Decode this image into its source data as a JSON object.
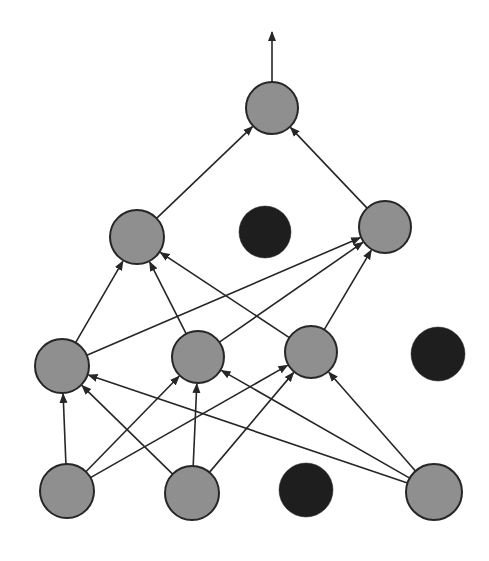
{
  "diagram": {
    "type": "network-graph",
    "colors": {
      "background": "#ffffff",
      "active_node_fill": "#8f8f8f",
      "dropped_node_fill": "#1e1e1e",
      "stroke": "#262626",
      "edge": "#262626"
    },
    "nodes": [
      {
        "id": "out",
        "layer": 0,
        "x": 272,
        "y": 108,
        "r": 26,
        "state": "active"
      },
      {
        "id": "h2a",
        "layer": 1,
        "x": 137,
        "y": 237,
        "r": 27,
        "state": "active"
      },
      {
        "id": "h2b",
        "layer": 1,
        "x": 265,
        "y": 232,
        "r": 26,
        "state": "dropped"
      },
      {
        "id": "h2c",
        "layer": 1,
        "x": 385,
        "y": 227,
        "r": 26,
        "state": "active"
      },
      {
        "id": "h1a",
        "layer": 2,
        "x": 62,
        "y": 366,
        "r": 27,
        "state": "active"
      },
      {
        "id": "h1b",
        "layer": 2,
        "x": 198,
        "y": 357,
        "r": 26,
        "state": "active"
      },
      {
        "id": "h1c",
        "layer": 2,
        "x": 311,
        "y": 352,
        "r": 26,
        "state": "active"
      },
      {
        "id": "h1d",
        "layer": 2,
        "x": 438,
        "y": 354,
        "r": 27,
        "state": "dropped"
      },
      {
        "id": "in_a",
        "layer": 3,
        "x": 67,
        "y": 491,
        "r": 27,
        "state": "active"
      },
      {
        "id": "in_b",
        "layer": 3,
        "x": 192,
        "y": 493,
        "r": 27,
        "state": "active"
      },
      {
        "id": "in_c",
        "layer": 3,
        "x": 306,
        "y": 490,
        "r": 27,
        "state": "dropped"
      },
      {
        "id": "in_d",
        "layer": 3,
        "x": 434,
        "y": 492,
        "r": 28,
        "state": "active"
      }
    ],
    "edges": [
      [
        "in_a",
        "h1a"
      ],
      [
        "in_a",
        "h1b"
      ],
      [
        "in_a",
        "h1c"
      ],
      [
        "in_b",
        "h1a"
      ],
      [
        "in_b",
        "h1b"
      ],
      [
        "in_b",
        "h1c"
      ],
      [
        "in_d",
        "h1a"
      ],
      [
        "in_d",
        "h1b"
      ],
      [
        "in_d",
        "h1c"
      ],
      [
        "h1a",
        "h2a"
      ],
      [
        "h1a",
        "h2c"
      ],
      [
        "h1b",
        "h2a"
      ],
      [
        "h1b",
        "h2c"
      ],
      [
        "h1c",
        "h2a"
      ],
      [
        "h1c",
        "h2c"
      ],
      [
        "h2a",
        "out"
      ],
      [
        "h2c",
        "out"
      ]
    ],
    "output_arrow": {
      "from": "out",
      "to_x": 272,
      "to_y": 32
    }
  }
}
